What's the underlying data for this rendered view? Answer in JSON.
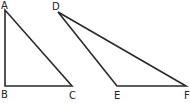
{
  "diagram": {
    "stroke_color": "#2a2a2a",
    "triangles": [
      {
        "name": "ABC",
        "vertices": [
          {
            "label": "A",
            "x": 5,
            "y": 10,
            "lx": 1,
            "ly": 9
          },
          {
            "label": "B",
            "x": 5,
            "y": 86,
            "lx": 1,
            "ly": 98
          },
          {
            "label": "C",
            "x": 72,
            "y": 86,
            "lx": 69,
            "ly": 99
          }
        ]
      },
      {
        "name": "DEF",
        "vertices": [
          {
            "label": "D",
            "x": 58,
            "y": 12,
            "lx": 52,
            "ly": 10
          },
          {
            "label": "E",
            "x": 117,
            "y": 86,
            "lx": 114,
            "ly": 99
          },
          {
            "label": "F",
            "x": 186,
            "y": 86,
            "lx": 184,
            "ly": 99
          }
        ]
      }
    ]
  }
}
